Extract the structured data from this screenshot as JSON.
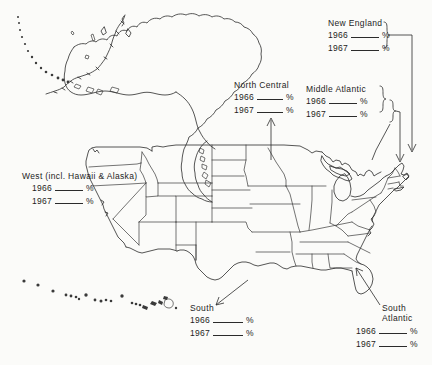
{
  "figure": {
    "type": "blank-worksheet-map",
    "background_color": "#fbfbf9",
    "line_color": "#2b2b2b"
  },
  "labels": [
    {
      "id": "new-england",
      "title": "New England",
      "rows": [
        {
          "year": "1966",
          "blank": "",
          "unit": "%"
        },
        {
          "year": "1967",
          "blank": "",
          "unit": "%"
        }
      ],
      "connector": "brace-right-to-arrow"
    },
    {
      "id": "middle-atlantic",
      "title": "Middle Atlantic",
      "rows": [
        {
          "year": "1966",
          "blank": "",
          "unit": "%"
        },
        {
          "year": "1967",
          "blank": "",
          "unit": "%"
        }
      ],
      "connector": "brace-right-to-arrow"
    },
    {
      "id": "north-central",
      "title": "North Central",
      "rows": [
        {
          "year": "1966",
          "blank": "",
          "unit": "%"
        },
        {
          "year": "1967",
          "blank": "",
          "unit": "%"
        }
      ],
      "connector": "arrow-down-to-map"
    },
    {
      "id": "west",
      "title": "West (incl. Hawaii & Alaska)",
      "rows": [
        {
          "year": "1966",
          "blank": "",
          "unit": "%"
        },
        {
          "year": "1967",
          "blank": "",
          "unit": "%"
        }
      ],
      "connector": "none"
    },
    {
      "id": "south",
      "title": "South",
      "rows": [
        {
          "year": "1966",
          "blank": "",
          "unit": "%"
        },
        {
          "year": "1967",
          "blank": "",
          "unit": "%"
        }
      ],
      "connector": "leader-line-up-right"
    },
    {
      "id": "south-atlantic",
      "title_line1": "South",
      "title_line2": "Atlantic",
      "rows": [
        {
          "year": "1966",
          "blank": "",
          "unit": "%"
        },
        {
          "year": "1967",
          "blank": "",
          "unit": "%"
        }
      ],
      "connector": "leader-line-up-left"
    }
  ]
}
